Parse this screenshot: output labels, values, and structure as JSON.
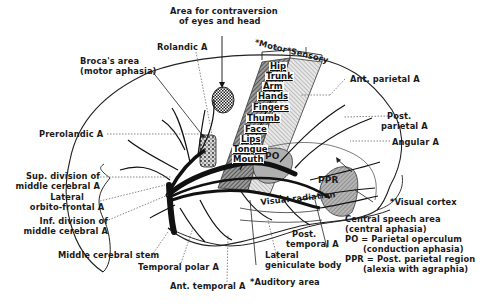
{
  "labels": {
    "contraversion": "Area for contraversion\n   of eyes and head",
    "rolandic": "Rolandic A",
    "broca": "Broca's area\n(motor aphasia)",
    "prerolandic": "Prerolandic A",
    "sup_division": "Sup. division of\nmiddle cerebral A",
    "lateral_orbitofrontal": "Lateral\norbito-frontal A",
    "inf_division": "Inf. division of\nmiddle cerebral A",
    "middle_cerebral_stem": "Middle cerebral stem",
    "temporal_polar": "Temporal polar A",
    "ant_temporal": "Ant. temporal A",
    "auditory_area": "*Auditory area",
    "lateral_geniculate": "Lateral\ngeniculate body",
    "post_temporal": "  Post.\ntemporal A",
    "ant_parietal": "Ant. parietal A",
    "post_parietal": "  Post.\nparietal A",
    "angular": "Angular A",
    "visual_cortex": "*Visual cortex",
    "visual_radiation": "Visual radiation",
    "motor_sensory": "*Motor*Sensory",
    "po": "PO",
    "ppr": "PPR"
  },
  "homunculus": [
    "Hip",
    "Trunk",
    "Arm",
    "Hands",
    "Fingers",
    "Thumb",
    "Face",
    "Lips",
    "Tongue",
    "Mouth"
  ],
  "legend": {
    "central_speech": "Central speech area",
    "central_aphasia": "(central aphasia)",
    "po_def": "PO = Parietal operculum",
    "po_aphasia": "      (conduction aphasia)",
    "ppr_def": "PPR = Post. parietal region",
    "ppr_aphasia": "      (alexia with agraphia)"
  }
}
